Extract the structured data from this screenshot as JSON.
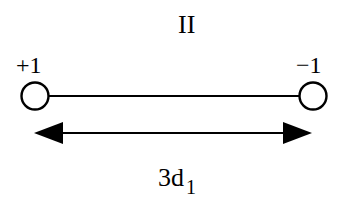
{
  "diagram": {
    "title": "II",
    "left_node": {
      "label": "+1"
    },
    "right_node": {
      "label": "−1"
    },
    "distance": {
      "base": "3d",
      "subscript": "1"
    }
  }
}
